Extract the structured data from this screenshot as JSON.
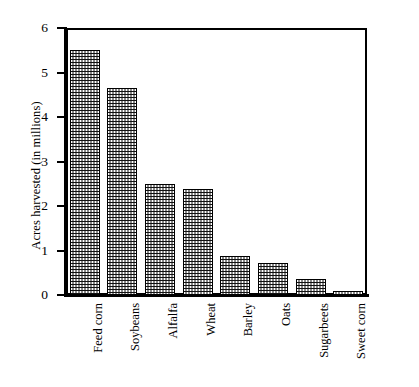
{
  "chart_data": {
    "type": "bar",
    "title": "",
    "subtitle": "",
    "xlabel": "",
    "ylabel": "Acres harvested (in millions)",
    "categories": [
      "Feed corn",
      "Soybeans",
      "Alfalfa",
      "Wheat",
      "Barley",
      "Oats",
      "Sugarbeets",
      "Sweet corn"
    ],
    "values": [
      5.5,
      4.65,
      2.5,
      2.38,
      0.88,
      0.73,
      0.37,
      0.1
    ],
    "ylim": [
      0,
      6
    ],
    "yticks": [
      0,
      1,
      2,
      3,
      4,
      5,
      6
    ],
    "ytick_labels": [
      "0",
      "1",
      "2",
      "3",
      "4",
      "5",
      "6"
    ],
    "grid": false,
    "legend": false,
    "legend_position": "none",
    "bar_fill": "dotted-checker-pattern",
    "bar_edge_color": "#000000",
    "axis_color": "#000000",
    "background_color": "#ffffff",
    "orientation": "vertical",
    "xtick_label_rotation": -90,
    "frame": "full-rectangle"
  }
}
